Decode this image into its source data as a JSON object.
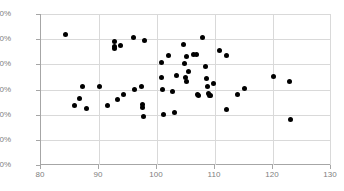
{
  "chart_data": {
    "type": "scatter",
    "title": "",
    "subtitle": "",
    "xlabel": "",
    "ylabel": "",
    "xlim": [
      80,
      130
    ],
    "ylim": [
      0.0,
      6.0
    ],
    "x_ticks": [
      80,
      90,
      100,
      110,
      120,
      130
    ],
    "x_tick_labels": [
      "80",
      "90",
      "100",
      "110",
      "120",
      "130"
    ],
    "y_ticks": [
      0.0,
      1.0,
      2.0,
      3.0,
      4.0,
      5.0,
      6.0
    ],
    "y_tick_labels": [
      "0.0%",
      "1.0%",
      "2.0%",
      "3.0%",
      "4.0%",
      "5.0%",
      "6.0%"
    ],
    "y_unit": "%",
    "grid": "horizontal-and-vertical",
    "legend": null,
    "legend_position": "none",
    "marker": {
      "shape": "circle",
      "color": "#000000",
      "size_px": 5
    },
    "axis_color": "#a6a6a6",
    "grid_color": "#d9d9d9",
    "tick_label_color": "#808080",
    "background_color": "#ffffff",
    "point_count": 62,
    "series": [
      {
        "name": "series-1",
        "points": [
          [
            84.2,
            5.2
          ],
          [
            85.8,
            2.37
          ],
          [
            86.7,
            2.65
          ],
          [
            87.1,
            3.13
          ],
          [
            87.8,
            2.26
          ],
          [
            90.0,
            3.11
          ],
          [
            91.5,
            2.38
          ],
          [
            92.6,
            4.9
          ],
          [
            92.7,
            4.72
          ],
          [
            92.7,
            4.64
          ],
          [
            93.2,
            2.61
          ],
          [
            93.7,
            4.73
          ],
          [
            94.3,
            2.8
          ],
          [
            95.9,
            5.06
          ],
          [
            96.1,
            3.0
          ],
          [
            97.3,
            3.13
          ],
          [
            97.5,
            2.42
          ],
          [
            97.5,
            2.28
          ],
          [
            97.6,
            1.93
          ],
          [
            97.8,
            4.96
          ],
          [
            100.7,
            4.09
          ],
          [
            100.8,
            3.46
          ],
          [
            100.9,
            3.0
          ],
          [
            101.2,
            2.0
          ],
          [
            102.0,
            4.35
          ],
          [
            102.6,
            2.92
          ],
          [
            103.0,
            2.09
          ],
          [
            103.3,
            3.55
          ],
          [
            104.6,
            4.78
          ],
          [
            104.8,
            4.02
          ],
          [
            104.9,
            3.48
          ],
          [
            105.0,
            3.32
          ],
          [
            105.1,
            4.33
          ],
          [
            105.4,
            3.72
          ],
          [
            106.3,
            4.38
          ],
          [
            106.8,
            4.4
          ],
          [
            107.0,
            2.82
          ],
          [
            107.2,
            2.78
          ],
          [
            107.8,
            5.06
          ],
          [
            108.4,
            3.93
          ],
          [
            108.6,
            3.44
          ],
          [
            108.7,
            3.11
          ],
          [
            108.8,
            2.86
          ],
          [
            109.0,
            2.76
          ],
          [
            109.2,
            2.75
          ],
          [
            109.8,
            3.22
          ],
          [
            110.7,
            4.53
          ],
          [
            111.9,
            4.34
          ],
          [
            112.0,
            2.22
          ],
          [
            113.9,
            2.81
          ],
          [
            115.0,
            3.05
          ],
          [
            120.0,
            3.5
          ],
          [
            122.8,
            3.33
          ],
          [
            123.0,
            1.81
          ]
        ]
      }
    ]
  }
}
